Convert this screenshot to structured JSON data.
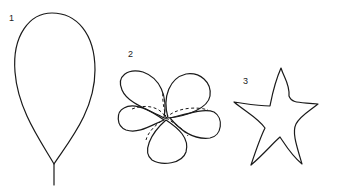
{
  "figures": [
    {
      "label": "1",
      "shape": "teardrop-petal-with-stem"
    },
    {
      "label": "2",
      "shape": "five-petal-flower-overlapping"
    },
    {
      "label": "3",
      "shape": "five-pointed-star-wavy"
    }
  ],
  "colors": {
    "line": "#1a1a1a",
    "background": "#ffffff"
  }
}
